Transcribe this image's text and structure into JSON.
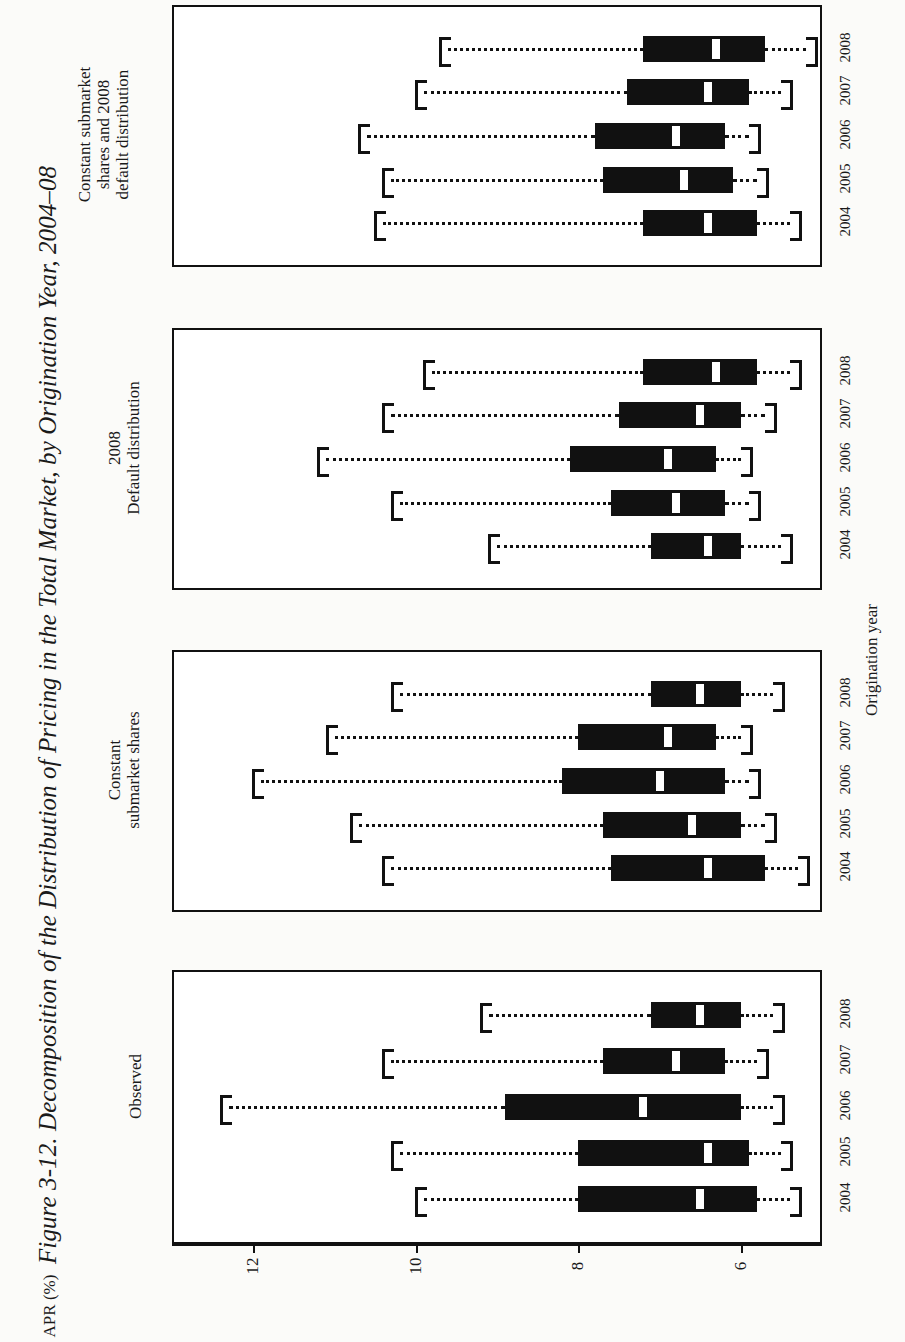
{
  "figure": {
    "title": "Figure 3-12. Decomposition of the Distribution of Pricing in the Total Market, by Origination Year, 2004–08",
    "x_axis_title": "Origination year",
    "y_axis_title": "APR (%)"
  },
  "chart_data": {
    "type": "box",
    "title": "Figure 3-12. Decomposition of the Distribution of Pricing in the Total Market, by Origination Year, 2004–08",
    "orientation": "horizontal",
    "xlabel": "Origination year",
    "ylabel": "APR (%)",
    "ylim": [
      13.0,
      5.0
    ],
    "yticks": [
      12,
      10,
      8,
      6
    ],
    "ytick_labels": [
      "12",
      "10",
      "8",
      "6"
    ],
    "grid": false,
    "legend": "none",
    "categories": [
      "2004",
      "2005",
      "2006",
      "2007",
      "2008"
    ],
    "panels": [
      {
        "name": "observed",
        "label": "Observed",
        "boxes": [
          {
            "year": "2004",
            "whisker_lo": 9.9,
            "q1": 8.0,
            "median": 6.5,
            "q3": 5.8,
            "whisker_hi": 5.4
          },
          {
            "year": "2005",
            "whisker_lo": 10.2,
            "q1": 8.0,
            "median": 6.4,
            "q3": 5.9,
            "whisker_hi": 5.5
          },
          {
            "year": "2006",
            "whisker_lo": 12.3,
            "q1": 8.9,
            "median": 7.2,
            "q3": 6.0,
            "whisker_hi": 5.6
          },
          {
            "year": "2007",
            "whisker_lo": 10.3,
            "q1": 7.7,
            "median": 6.8,
            "q3": 6.2,
            "whisker_hi": 5.8
          },
          {
            "year": "2008",
            "whisker_lo": 9.1,
            "q1": 7.1,
            "median": 6.5,
            "q3": 6.0,
            "whisker_hi": 5.6
          }
        ]
      },
      {
        "name": "constant-submarket-shares",
        "label": "Constant\nsubmarket shares",
        "boxes": [
          {
            "year": "2004",
            "whisker_lo": 10.3,
            "q1": 7.6,
            "median": 6.4,
            "q3": 5.7,
            "whisker_hi": 5.3
          },
          {
            "year": "2005",
            "whisker_lo": 10.7,
            "q1": 7.7,
            "median": 6.6,
            "q3": 6.0,
            "whisker_hi": 5.7
          },
          {
            "year": "2006",
            "whisker_lo": 11.9,
            "q1": 8.2,
            "median": 7.0,
            "q3": 6.2,
            "whisker_hi": 5.9
          },
          {
            "year": "2007",
            "whisker_lo": 11.0,
            "q1": 8.0,
            "median": 6.9,
            "q3": 6.3,
            "whisker_hi": 6.0
          },
          {
            "year": "2008",
            "whisker_lo": 10.2,
            "q1": 7.1,
            "median": 6.5,
            "q3": 6.0,
            "whisker_hi": 5.6
          }
        ]
      },
      {
        "name": "default-distribution-2008",
        "label": "2008\nDefault distribution",
        "boxes": [
          {
            "year": "2004",
            "whisker_lo": 9.0,
            "q1": 7.1,
            "median": 6.4,
            "q3": 6.0,
            "whisker_hi": 5.5
          },
          {
            "year": "2005",
            "whisker_lo": 10.2,
            "q1": 7.6,
            "median": 6.8,
            "q3": 6.2,
            "whisker_hi": 5.9
          },
          {
            "year": "2006",
            "whisker_lo": 11.1,
            "q1": 8.1,
            "median": 6.9,
            "q3": 6.3,
            "whisker_hi": 6.0
          },
          {
            "year": "2007",
            "whisker_lo": 10.3,
            "q1": 7.5,
            "median": 6.5,
            "q3": 6.0,
            "whisker_hi": 5.7
          },
          {
            "year": "2008",
            "whisker_lo": 9.8,
            "q1": 7.2,
            "median": 6.3,
            "q3": 5.8,
            "whisker_hi": 5.4
          }
        ]
      },
      {
        "name": "constant-shares-and-2008-default",
        "label": "Constant submarket\nshares and 2008\ndefault distribution",
        "boxes": [
          {
            "year": "2004",
            "whisker_lo": 10.4,
            "q1": 7.2,
            "median": 6.4,
            "q3": 5.8,
            "whisker_hi": 5.4
          },
          {
            "year": "2005",
            "whisker_lo": 10.3,
            "q1": 7.7,
            "median": 6.7,
            "q3": 6.1,
            "whisker_hi": 5.8
          },
          {
            "year": "2006",
            "whisker_lo": 10.6,
            "q1": 7.8,
            "median": 6.8,
            "q3": 6.2,
            "whisker_hi": 5.9
          },
          {
            "year": "2007",
            "whisker_lo": 9.9,
            "q1": 7.4,
            "median": 6.4,
            "q3": 5.9,
            "whisker_hi": 5.5
          },
          {
            "year": "2008",
            "whisker_lo": 9.6,
            "q1": 7.2,
            "median": 6.3,
            "q3": 5.7,
            "whisker_hi": 5.2
          }
        ]
      }
    ]
  },
  "colors": {
    "ink": "#111111",
    "paper": "#fbfbf9",
    "panel": "#ffffff",
    "median": "#ffffff"
  }
}
